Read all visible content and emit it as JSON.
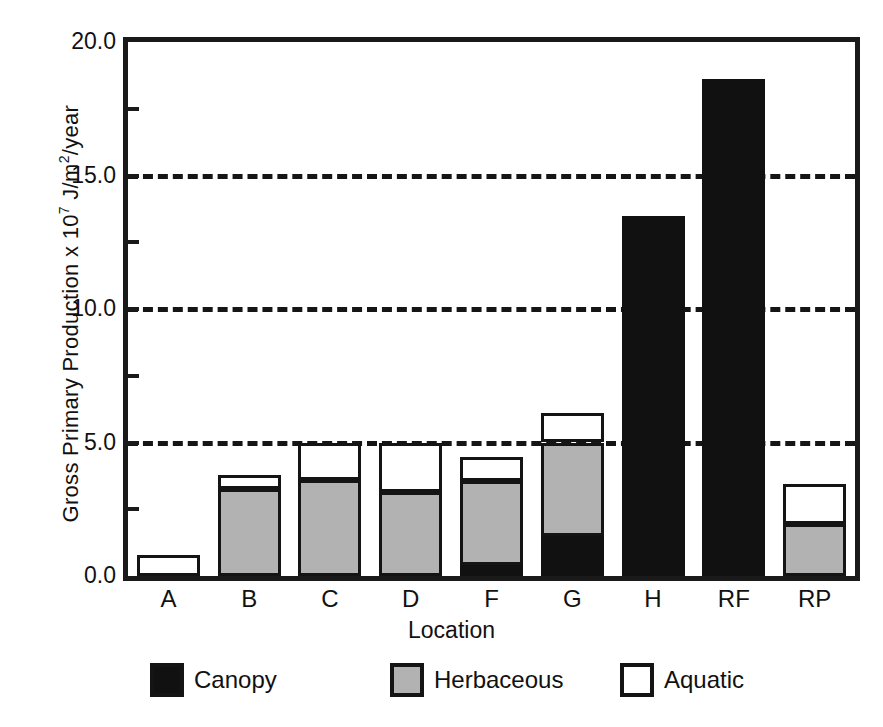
{
  "chart_data": {
    "type": "bar",
    "stacked": true,
    "title": "",
    "xlabel": "Location",
    "ylabel": "Gross Primary Production x 10^7 J/m2/year",
    "ylabel_prefix": "Gross Primary Production  x 10",
    "ylabel_exponent": "7",
    "ylabel_suffix_a": " J/m",
    "ylabel_exponent2": "2",
    "ylabel_suffix_b": "/year",
    "categories": [
      "A",
      "B",
      "C",
      "D",
      "F",
      "G",
      "H",
      "RF",
      "RP"
    ],
    "series": [
      {
        "name": "Canopy",
        "color": "#111111",
        "values": [
          0.0,
          0.0,
          0.0,
          0.0,
          0.4,
          1.5,
          13.5,
          18.6,
          0.0
        ]
      },
      {
        "name": "Herbaceous",
        "color": "#b2b2b2",
        "values": [
          0.0,
          3.25,
          3.6,
          3.15,
          3.15,
          3.5,
          0.0,
          0.0,
          1.95
        ]
      },
      {
        "name": "Aquatic",
        "color": "#ffffff",
        "values": [
          0.8,
          0.55,
          1.4,
          1.85,
          0.9,
          1.1,
          0.0,
          0.0,
          1.5
        ]
      }
    ],
    "totals": [
      0.8,
      3.8,
      5.0,
      5.0,
      4.45,
      6.1,
      13.5,
      18.6,
      3.45
    ],
    "ylim": [
      0.0,
      20.0
    ],
    "yticks": [
      "0.0",
      "5.0",
      "10.0",
      "15.0",
      "20.0"
    ],
    "ytick_values": [
      0.0,
      5.0,
      10.0,
      15.0,
      20.0
    ],
    "yminor_ticks": [
      2.5,
      7.5,
      12.5,
      17.5
    ],
    "gridlines": [
      5.0,
      10.0,
      15.0
    ],
    "grid_style": "dashed",
    "legend_position": "bottom",
    "legend": [
      {
        "label": "Canopy",
        "swatch": "black-swatch"
      },
      {
        "label": "Herbaceous",
        "swatch": "gray-swatch"
      },
      {
        "label": "Aquatic",
        "swatch": "white-swatch"
      }
    ]
  }
}
